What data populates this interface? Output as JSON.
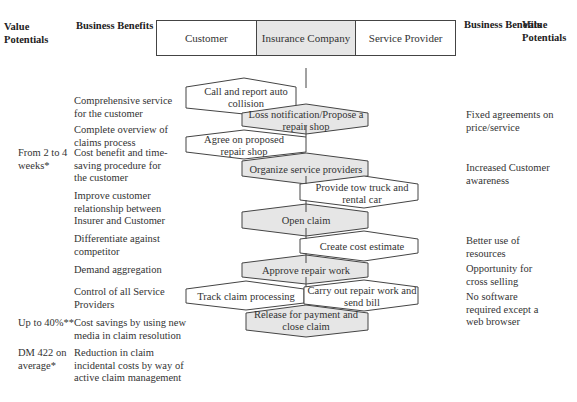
{
  "header": {
    "left_value_title": "Value Potentials",
    "left_benefits_title": "Business Benefits",
    "right_benefits_title": "Business Benefits",
    "right_value_title": "Value Potentials",
    "lanes": [
      {
        "label": "Customer",
        "shaded": false
      },
      {
        "label": "Insurance Company",
        "shaded": true
      },
      {
        "label": "Service Provider",
        "shaded": false
      }
    ]
  },
  "left_column": {
    "values": [
      {
        "text": "From 2 to 4 weeks*"
      },
      {
        "text": "Up to 40%**"
      },
      {
        "text": "DM 422 on average*"
      }
    ],
    "benefits": [
      {
        "text": "Comprehensive service for the customer"
      },
      {
        "text": "Complete overview of claims process"
      },
      {
        "text": "Cost benefit and time-saving procedure for the customer"
      },
      {
        "text": "Improve customer relationship between Insurer and Customer"
      },
      {
        "text": "Differentiate against competitor"
      },
      {
        "text": "Demand aggregation"
      },
      {
        "text": "Control of all Service Providers"
      },
      {
        "text": "Cost savings by using new media in claim resolution"
      },
      {
        "text": "Reduction in claim incidental costs by way of active claim management"
      }
    ]
  },
  "right_column": {
    "benefits": [
      {
        "text": "Fixed agreements on price/service"
      },
      {
        "text": "Increased Customer awareness"
      },
      {
        "text": "Better use of resources"
      },
      {
        "text": "Opportunity for cross selling"
      },
      {
        "text": "No software required except a web browser"
      }
    ]
  },
  "process_steps": [
    {
      "label": "Call and report auto collision",
      "lane": "Customer"
    },
    {
      "label": "Loss notification/Propose a repair shop",
      "lane": "Insurance Company"
    },
    {
      "label": "Agree on proposed repair shop",
      "lane": "Customer"
    },
    {
      "label": "Organize service providers",
      "lane": "Insurance Company"
    },
    {
      "label": "Provide tow truck and rental car",
      "lane": "Service Provider"
    },
    {
      "label": "Open claim",
      "lane": "Insurance Company"
    },
    {
      "label": "Create cost estimate",
      "lane": "Service Provider"
    },
    {
      "label": "Approve repair work",
      "lane": "Insurance Company"
    },
    {
      "label": "Track claim processing",
      "lane": "Customer"
    },
    {
      "label": "Carry out repair work and send bill",
      "lane": "Service Provider"
    },
    {
      "label": "Release for payment and close claim",
      "lane": "Insurance Company"
    }
  ],
  "colors": {
    "insurer_fill": "#e6e6e6",
    "other_fill": "#ffffff",
    "stroke": "#444444"
  }
}
